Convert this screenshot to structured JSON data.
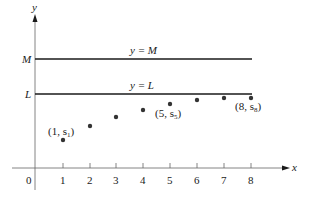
{
  "axes": {
    "x_label": "x",
    "y_label": "y",
    "origin_label": "0",
    "x_ticks": [
      "1",
      "2",
      "3",
      "4",
      "5",
      "6",
      "7",
      "8"
    ]
  },
  "bounds": {
    "upper": {
      "axis_label": "M",
      "line_label": "y = M"
    },
    "lower": {
      "axis_label": "L",
      "line_label": "y = L"
    }
  },
  "points": [
    {
      "n": 1,
      "label_main": "(1, s",
      "label_sub": "1",
      "label_close": ")"
    },
    {
      "n": 5,
      "label_main": "(5, s",
      "label_sub": "5",
      "label_close": ")"
    },
    {
      "n": 8,
      "label_main": "(8, s",
      "label_sub": "8",
      "label_close": ")"
    }
  ],
  "colors": {
    "ink": "#1a1a1a",
    "axis": "#555555",
    "background": "#ffffff"
  }
}
